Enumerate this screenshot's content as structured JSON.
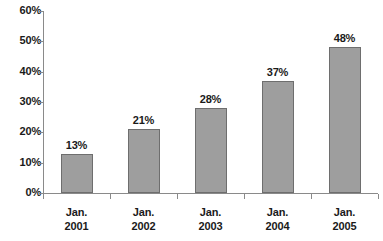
{
  "chart_data": {
    "type": "bar",
    "title": "",
    "subtitle": "",
    "xlabel": "",
    "ylabel": "",
    "categories": [
      "Jan. 2001",
      "Jan. 2002",
      "Jan. 2003",
      "Jan. 2004",
      "Jan. 2005"
    ],
    "category_lines": [
      {
        "line1": "Jan.",
        "line2": "2001"
      },
      {
        "line1": "Jan.",
        "line2": "2002"
      },
      {
        "line1": "Jan.",
        "line2": "2003"
      },
      {
        "line1": "Jan.",
        "line2": "2004"
      },
      {
        "line1": "Jan.",
        "line2": "2005"
      }
    ],
    "values": [
      13,
      21,
      28,
      37,
      48
    ],
    "value_labels": [
      "13%",
      "21%",
      "28%",
      "37%",
      "48%"
    ],
    "ylim": [
      0,
      60
    ],
    "ytick_values": [
      0,
      10,
      20,
      30,
      40,
      50,
      60
    ],
    "ytick_labels": [
      "0%",
      "10%",
      "20%",
      "30%",
      "40%",
      "50%",
      "60%"
    ],
    "grid": false,
    "legend": null,
    "bar_color": "#9e9e9e",
    "bar_border_color": "#6e6e6e",
    "axis_color": "#8a8a8a",
    "text_color": "#1a1a1a",
    "background": "#ffffff"
  }
}
